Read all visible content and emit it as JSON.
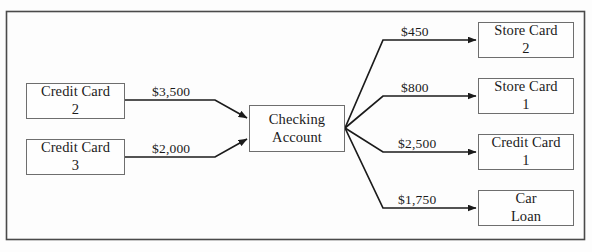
{
  "diagram": {
    "type": "flow-diagram",
    "frame": {
      "border_color": "#4a4a4a"
    },
    "colors": {
      "box_border": "#6e6e6e",
      "arrow": "#1b1b1b",
      "text": "#1b1b1b",
      "background": "#fdfdfd"
    },
    "sources": [
      {
        "id": "credit-card-2",
        "line1": "Credit Card",
        "line2": "2",
        "amount": "$3,500"
      },
      {
        "id": "credit-card-3",
        "line1": "Credit Card",
        "line2": "3",
        "amount": "$2,000"
      }
    ],
    "hub": {
      "id": "checking-account",
      "line1": "Checking",
      "line2": "Account"
    },
    "targets": [
      {
        "id": "store-card-2",
        "line1": "Store Card",
        "line2": "2",
        "amount": "$450"
      },
      {
        "id": "store-card-1",
        "line1": "Store Card",
        "line2": "1",
        "amount": "$800"
      },
      {
        "id": "credit-card-1",
        "line1": "Credit Card",
        "line2": "1",
        "amount": "$2,500"
      },
      {
        "id": "car-loan",
        "line1": "Car",
        "line2": "Loan",
        "amount": "$1,750"
      }
    ]
  }
}
